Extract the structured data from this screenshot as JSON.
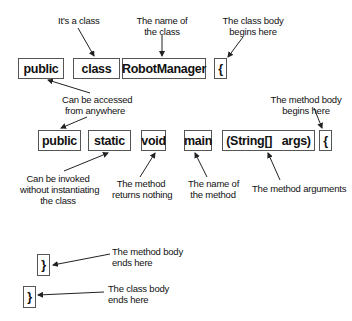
{
  "diagram": {
    "title": "",
    "class_declaration": {
      "tokens": [
        {
          "text": "public",
          "note": "Can be accessed\nfrom anywhere"
        },
        {
          "text": "class",
          "note": "It's a class"
        },
        {
          "text": "RobotManager",
          "note": "The name of\nthe class"
        },
        {
          "text": "{",
          "note": "The class body\nbegins here"
        }
      ]
    },
    "method_declaration": {
      "tokens": [
        {
          "text": "public",
          "note": ""
        },
        {
          "text": "static",
          "note": "Can be invoked\nwithout instantiating\nthe class"
        },
        {
          "text": "void",
          "note": "The method\nreturns nothing"
        },
        {
          "text": "main",
          "note": "The name of\nthe method"
        },
        {
          "text": "(String[]   args)",
          "note": "The method arguments"
        },
        {
          "text": "{",
          "note": "The method body\nbegins here"
        }
      ]
    },
    "closing": {
      "tokens": [
        {
          "text": "}",
          "note": "The method body\nends here"
        },
        {
          "text": "}",
          "note": "The class body\nends here"
        }
      ]
    },
    "labels": {
      "its_a_class": "It's a class",
      "name_of_class_1": "The name of",
      "name_of_class_2": "the class",
      "class_body_begins_1": "The class body",
      "class_body_begins_2": "begins here",
      "accessed_1": "Can be accessed",
      "accessed_2": "from anywhere",
      "method_body_begins_1": "The method body",
      "method_body_begins_2": "begins here",
      "invoked_1": "Can be invoked",
      "invoked_2": "without instantiating",
      "invoked_3": "the class",
      "returns_1": "The method",
      "returns_2": "returns nothing",
      "method_name_1": "The name of",
      "method_name_2": "the method",
      "method_args": "The method arguments",
      "method_body_ends_1": "The method body",
      "method_body_ends_2": "ends here",
      "class_body_ends_1": "The class body",
      "class_body_ends_2": "ends here"
    }
  }
}
